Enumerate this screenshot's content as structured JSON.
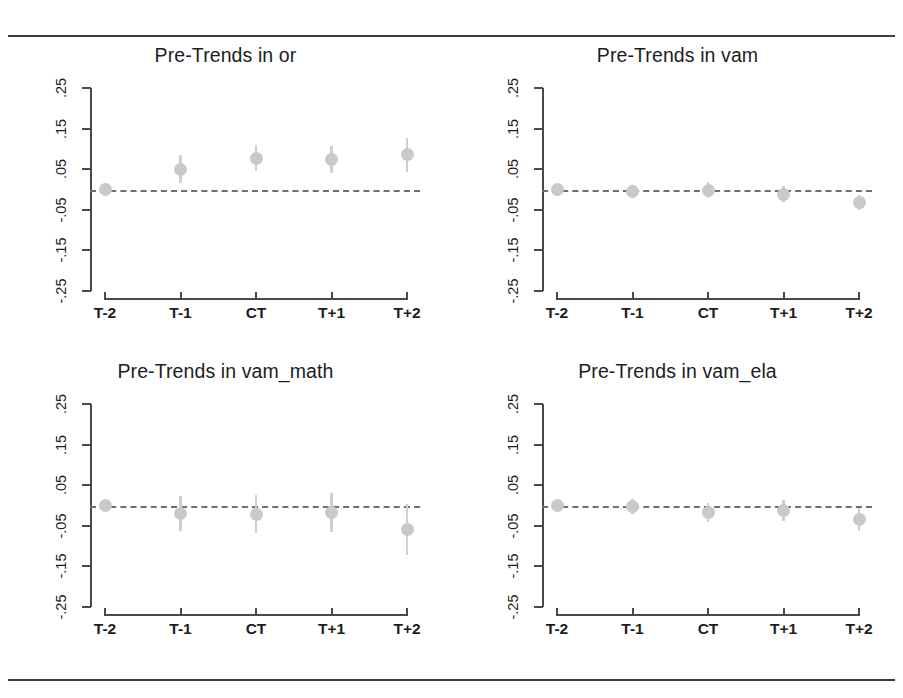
{
  "figure": {
    "rule_color": "#3d3d3d",
    "marker_color": "#c9c9c9",
    "ci_color": "#cfcfcf",
    "zero_line_color": "#6f6f6f"
  },
  "chart_data": [
    {
      "type": "scatter",
      "title": "Pre-Trends in or",
      "xlabel": "",
      "ylabel": "",
      "categories": [
        "T-2",
        "T-1",
        "CT",
        "T+1",
        "T+2"
      ],
      "values": [
        0,
        0.05,
        0.077,
        0.073,
        0.085
      ],
      "ci_low": [
        0,
        0.015,
        0.046,
        0.04,
        0.043
      ],
      "ci_high": [
        0,
        0.085,
        0.109,
        0.108,
        0.128
      ],
      "yticks": [
        ".25",
        ".15",
        ".05",
        "-.05",
        "-.15",
        "-.25"
      ],
      "ytickvals": [
        0.25,
        0.15,
        0.05,
        -0.05,
        -0.15,
        -0.25
      ],
      "ylim": [
        -0.25,
        0.25
      ],
      "grid": false,
      "legend": "none",
      "zero_line": 0
    },
    {
      "type": "scatter",
      "title": "Pre-Trends in vam",
      "xlabel": "",
      "ylabel": "",
      "categories": [
        "T-2",
        "T-1",
        "CT",
        "T+1",
        "T+2"
      ],
      "values": [
        0,
        -0.004,
        -0.002,
        -0.012,
        -0.032
      ],
      "ci_low": [
        0,
        -0.02,
        -0.022,
        -0.032,
        -0.05
      ],
      "ci_high": [
        0,
        0.012,
        0.018,
        0.009,
        -0.014
      ],
      "yticks": [
        ".25",
        ".15",
        ".05",
        "-.05",
        "-.15",
        "-.25"
      ],
      "ytickvals": [
        0.25,
        0.15,
        0.05,
        -0.05,
        -0.15,
        -0.25
      ],
      "ylim": [
        -0.25,
        0.25
      ],
      "grid": false,
      "legend": "none",
      "zero_line": 0
    },
    {
      "type": "scatter",
      "title": "Pre-Trends in vam_math",
      "xlabel": "",
      "ylabel": "",
      "categories": [
        "T-2",
        "T-1",
        "CT",
        "T+1",
        "T+2"
      ],
      "values": [
        0,
        -0.019,
        -0.021,
        -0.017,
        -0.059
      ],
      "ci_low": [
        0,
        -0.062,
        -0.068,
        -0.066,
        -0.123
      ],
      "ci_high": [
        0,
        0.023,
        0.026,
        0.031,
        0.003
      ],
      "yticks": [
        ".25",
        ".15",
        ".05",
        "-.05",
        "-.15",
        "-.25"
      ],
      "ytickvals": [
        0.25,
        0.15,
        0.05,
        -0.05,
        -0.15,
        -0.25
      ],
      "ylim": [
        -0.25,
        0.25
      ],
      "grid": false,
      "legend": "none",
      "zero_line": 0
    },
    {
      "type": "scatter",
      "title": "Pre-Trends in vam_ela",
      "xlabel": "",
      "ylabel": "",
      "categories": [
        "T-2",
        "T-1",
        "CT",
        "T+1",
        "T+2"
      ],
      "values": [
        0,
        -0.003,
        -0.018,
        -0.013,
        -0.035
      ],
      "ci_low": [
        0,
        -0.022,
        -0.04,
        -0.038,
        -0.063
      ],
      "ci_high": [
        0,
        0.017,
        0.005,
        0.013,
        -0.007
      ],
      "yticks": [
        ".25",
        ".15",
        ".05",
        "-.05",
        "-.15",
        "-.25"
      ],
      "ytickvals": [
        0.25,
        0.15,
        0.05,
        -0.05,
        -0.15,
        -0.25
      ],
      "ylim": [
        -0.25,
        0.25
      ],
      "grid": false,
      "legend": "none",
      "zero_line": 0
    }
  ]
}
